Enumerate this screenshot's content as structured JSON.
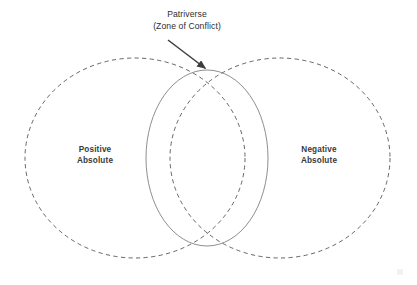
{
  "diagram": {
    "type": "venn",
    "background_color": "#ffffff",
    "callout": {
      "line1": "Patriverse",
      "line2": "(Zone of Conflict)",
      "text_color": "#2e2e2e",
      "leader_line": {
        "from_x": 168,
        "from_y": 40,
        "to_x": 207,
        "to_y": 70,
        "color": "#3d3d3d",
        "arrowhead": "triangle"
      }
    },
    "sets": [
      {
        "id": "positive-absolute",
        "label_line1": "Positive",
        "label_line2": "Absolute",
        "label_x": 95,
        "label_y": 152,
        "stroke_style": "dashed",
        "stroke_color": "#555555",
        "fill": "none",
        "center_x": 135,
        "center_y": 158,
        "radius_x": 110,
        "radius_y": 100
      },
      {
        "id": "negative-absolute",
        "label_line1": "Negative",
        "label_line2": "Absolute",
        "label_x": 319,
        "label_y": 152,
        "stroke_style": "dashed",
        "stroke_color": "#555555",
        "fill": "none",
        "center_x": 280,
        "center_y": 158,
        "radius_x": 110,
        "radius_y": 100
      }
    ],
    "intersection": {
      "id": "patriverse-zone",
      "stroke_style": "solid",
      "stroke_color": "#7a7a7a",
      "fill": "none",
      "center_x": 207,
      "center_y": 158,
      "radius_x": 61,
      "radius_y": 88,
      "top_vertex_x": 207,
      "top_vertex_y": 70,
      "bottom_vertex_x": 207,
      "bottom_vertex_y": 246
    }
  }
}
